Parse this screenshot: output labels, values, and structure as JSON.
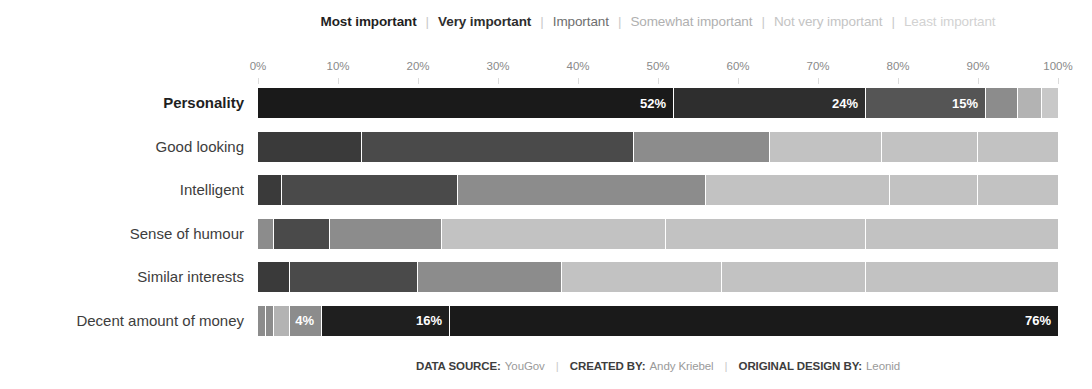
{
  "legend": {
    "separator": "|",
    "entries": [
      {
        "label": "Most important",
        "color": "#1a1a1a",
        "text_color": "#1f1f1f",
        "bold": true
      },
      {
        "label": "Very important",
        "color": "#2e2e2e",
        "text_color": "#2e2e2e",
        "bold": true
      },
      {
        "label": "Important",
        "color": "#555555",
        "text_color": "#6e6e6e",
        "bold": false
      },
      {
        "label": "Somewhat important",
        "color": "#8c8c8c",
        "text_color": "#b0b0b0",
        "bold": false
      },
      {
        "label": "Not very important",
        "color": "#b3b3b3",
        "text_color": "#c4c4c4",
        "bold": false
      },
      {
        "label": "Least important",
        "color": "#c8c8c8",
        "text_color": "#d2d2d2",
        "bold": false
      }
    ]
  },
  "axis": {
    "ticks": [
      "0%",
      "10%",
      "20%",
      "30%",
      "40%",
      "50%",
      "60%",
      "70%",
      "80%",
      "90%",
      "100%"
    ]
  },
  "footer": {
    "items": [
      {
        "key": "DATA SOURCE:",
        "value": "YouGov"
      },
      {
        "key": "CREATED BY:",
        "value": "Andy Kriebel"
      },
      {
        "key": "ORIGINAL DESIGN BY:",
        "value": "Leonid"
      }
    ],
    "separator": "|"
  },
  "chart_data": {
    "type": "bar",
    "subtype": "stacked-horizontal-100-percent",
    "title": "",
    "xlabel": "",
    "ylabel": "",
    "xlim": [
      0,
      100
    ],
    "grid": false,
    "legend_position": "top",
    "categories": [
      "Personality",
      "Good looking",
      "Intelligent",
      "Sense of humour",
      "Similar interests",
      "Decent amount of money"
    ],
    "series": [
      {
        "name": "Most important",
        "color": "#1a1a1a",
        "values": [
          52,
          13,
          3,
          2,
          4,
          1
        ]
      },
      {
        "name": "Very important",
        "color": "#2e2e2e",
        "values": [
          24,
          34,
          22,
          7,
          16,
          1
        ]
      },
      {
        "name": "Important",
        "color": "#555555",
        "values": [
          15,
          17,
          31,
          14,
          18,
          2
        ]
      },
      {
        "name": "Somewhat important",
        "color": "#8c8c8c",
        "values": [
          4,
          14,
          23,
          28,
          20,
          4
        ]
      },
      {
        "name": "Not very important",
        "color": "#b3b3b3",
        "values": [
          3,
          12,
          11,
          25,
          18,
          16
        ]
      },
      {
        "name": "Least important",
        "color": "#c8c8c8",
        "values": [
          2,
          10,
          10,
          24,
          24,
          76
        ]
      }
    ],
    "rows": [
      {
        "label": "Personality",
        "emphasis": true,
        "segments": [
          {
            "series": "Most important",
            "value": 52,
            "color": "#1a1a1a",
            "label": "52%"
          },
          {
            "series": "Very important",
            "value": 24,
            "color": "#2e2e2e",
            "label": "24%"
          },
          {
            "series": "Important",
            "value": 15,
            "color": "#555555",
            "label": "15%"
          },
          {
            "series": "Somewhat important",
            "value": 4,
            "color": "#8c8c8c",
            "label": ""
          },
          {
            "series": "Not very important",
            "value": 3,
            "color": "#b3b3b3",
            "label": ""
          },
          {
            "series": "Least important",
            "value": 2,
            "color": "#c8c8c8",
            "label": ""
          }
        ]
      },
      {
        "label": "Good looking",
        "emphasis": false,
        "segments": [
          {
            "series": "Most important",
            "value": 13,
            "color": "#3a3a3a",
            "label": ""
          },
          {
            "series": "Very important",
            "value": 34,
            "color": "#4a4a4a",
            "label": ""
          },
          {
            "series": "Important",
            "value": 17,
            "color": "#8c8c8c",
            "label": ""
          },
          {
            "series": "Somewhat important",
            "value": 14,
            "color": "#c2c2c2",
            "label": ""
          },
          {
            "series": "Not very important",
            "value": 12,
            "color": "#c2c2c2",
            "label": ""
          },
          {
            "series": "Least important",
            "value": 10,
            "color": "#c2c2c2",
            "label": ""
          }
        ]
      },
      {
        "label": "Intelligent",
        "emphasis": false,
        "segments": [
          {
            "series": "Most important",
            "value": 3,
            "color": "#3a3a3a",
            "label": ""
          },
          {
            "series": "Very important",
            "value": 22,
            "color": "#4a4a4a",
            "label": ""
          },
          {
            "series": "Important",
            "value": 31,
            "color": "#8c8c8c",
            "label": ""
          },
          {
            "series": "Somewhat important",
            "value": 23,
            "color": "#c2c2c2",
            "label": ""
          },
          {
            "series": "Not very important",
            "value": 11,
            "color": "#c2c2c2",
            "label": ""
          },
          {
            "series": "Least important",
            "value": 10,
            "color": "#c2c2c2",
            "label": ""
          }
        ]
      },
      {
        "label": "Sense of humour",
        "emphasis": false,
        "segments": [
          {
            "series": "Most important",
            "value": 2,
            "color": "#8c8c8c",
            "label": ""
          },
          {
            "series": "Very important",
            "value": 7,
            "color": "#4a4a4a",
            "label": ""
          },
          {
            "series": "Important",
            "value": 14,
            "color": "#8c8c8c",
            "label": ""
          },
          {
            "series": "Somewhat important",
            "value": 28,
            "color": "#c2c2c2",
            "label": ""
          },
          {
            "series": "Not very important",
            "value": 25,
            "color": "#c2c2c2",
            "label": ""
          },
          {
            "series": "Least important",
            "value": 24,
            "color": "#c2c2c2",
            "label": ""
          }
        ]
      },
      {
        "label": "Similar interests",
        "emphasis": false,
        "segments": [
          {
            "series": "Most important",
            "value": 4,
            "color": "#3a3a3a",
            "label": ""
          },
          {
            "series": "Very important",
            "value": 16,
            "color": "#4a4a4a",
            "label": ""
          },
          {
            "series": "Important",
            "value": 18,
            "color": "#8c8c8c",
            "label": ""
          },
          {
            "series": "Somewhat important",
            "value": 20,
            "color": "#c2c2c2",
            "label": ""
          },
          {
            "series": "Not very important",
            "value": 18,
            "color": "#c2c2c2",
            "label": ""
          },
          {
            "series": "Least important",
            "value": 24,
            "color": "#c2c2c2",
            "label": ""
          }
        ]
      },
      {
        "label": "Decent amount of money",
        "emphasis": false,
        "segments": [
          {
            "series": "Most important",
            "value": 1,
            "color": "#8c8c8c",
            "label": ""
          },
          {
            "series": "Very important",
            "value": 1,
            "color": "#8c8c8c",
            "label": ""
          },
          {
            "series": "Important",
            "value": 2,
            "color": "#b3b3b3",
            "label": ""
          },
          {
            "series": "Somewhat important",
            "value": 4,
            "color": "#8c8c8c",
            "label": "4%"
          },
          {
            "series": "Not very important",
            "value": 16,
            "color": "#1f1f1f",
            "label": "16%"
          },
          {
            "series": "Least important",
            "value": 76,
            "color": "#1a1a1a",
            "label": "76%"
          }
        ]
      }
    ]
  }
}
